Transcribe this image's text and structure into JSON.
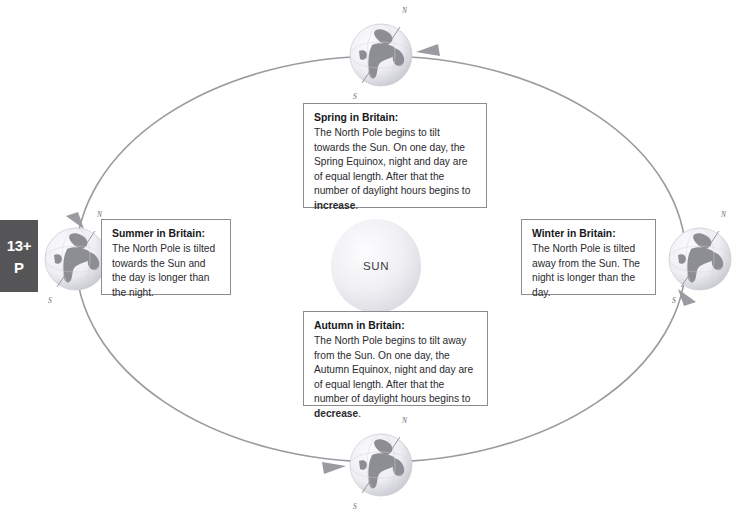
{
  "diagram": {
    "title_text": "Seasons diagram — Earth's orbit around the Sun",
    "sun_label": "SUN",
    "orbit_direction": "counter-clockwise",
    "colors": {
      "orbit_line": "#9a9aa0",
      "box_border": "#8b8b90",
      "badge_background": "#555457",
      "badge_text": "#ffffff",
      "sun_fill": "#ececf0",
      "globe_land": "#8e8e95",
      "globe_ocean": "#e8e8ee",
      "body_text": "#2a2a2e"
    }
  },
  "badge": {
    "age_label": "13+",
    "code_label": "P"
  },
  "globes": [
    {
      "name": "globe-top",
      "north_label": "N",
      "south_label": "S"
    },
    {
      "name": "globe-right",
      "north_label": "N",
      "south_label": "S"
    },
    {
      "name": "globe-bottom",
      "north_label": "N",
      "south_label": "S"
    },
    {
      "name": "globe-left",
      "north_label": "N",
      "south_label": "S"
    }
  ],
  "callouts": {
    "spring": {
      "title": "Spring in Britain:",
      "body_before": "The North Pole begins to tilt towards the Sun. On one day, the Spring Equinox, night and day are of equal length. After that the number of daylight hours begins to ",
      "emphasis": "increase",
      "body_after": "."
    },
    "summer": {
      "title": "Summer in Britain:",
      "body_before": "The North Pole is tilted towards the Sun and the day is longer than the night.",
      "emphasis": "",
      "body_after": ""
    },
    "autumn": {
      "title": "Autumn in Britain:",
      "body_before": "The North Pole begins to tilt away from the Sun. On one day, the Autumn Equinox, night and day are of equal length. After that the number of daylight hours begins to ",
      "emphasis": "decrease",
      "body_after": "."
    },
    "winter": {
      "title": "Winter in Britain:",
      "body_before": "The North Pole is tilted away from the Sun. The night is longer than the day.",
      "emphasis": "",
      "body_after": ""
    }
  }
}
